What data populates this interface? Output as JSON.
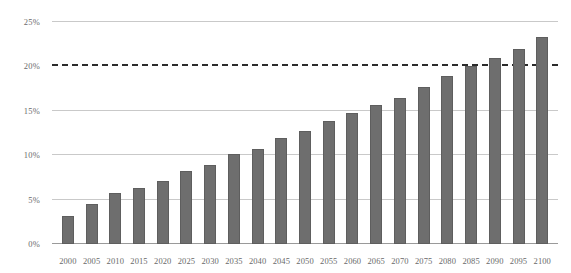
{
  "chart_data": {
    "type": "bar",
    "title": "",
    "subtitle": "",
    "xlabel": "",
    "ylabel": "",
    "ylim": [
      0,
      25
    ],
    "ytick_labels": [
      "0%",
      "5%",
      "10%",
      "15%",
      "20%",
      "25%"
    ],
    "ytick_values": [
      0,
      5,
      10,
      15,
      20,
      25
    ],
    "grid": true,
    "legend": null,
    "categories": [
      "2000",
      "2005",
      "2010",
      "2015",
      "2020",
      "2025",
      "2030",
      "2035",
      "2040",
      "2045",
      "2050",
      "2055",
      "2060",
      "2065",
      "2070",
      "2075",
      "2080",
      "2085",
      "2090",
      "2095",
      "2100"
    ],
    "values": [
      3.1,
      4.5,
      5.7,
      6.3,
      7.1,
      8.2,
      8.9,
      10.1,
      10.7,
      11.9,
      12.7,
      13.8,
      14.7,
      15.6,
      16.4,
      17.7,
      18.9,
      20.0,
      20.9,
      22.0,
      23.3
    ],
    "bar_color": "#6e6e6e",
    "annotations": [
      {
        "type": "threshold-line",
        "value": 20,
        "style": "dashed",
        "color": "#2b2b2b",
        "label": ""
      }
    ],
    "gridline_color": "#c9c9c9",
    "axis_color": "#9a9a9a",
    "background": "#ffffff"
  }
}
